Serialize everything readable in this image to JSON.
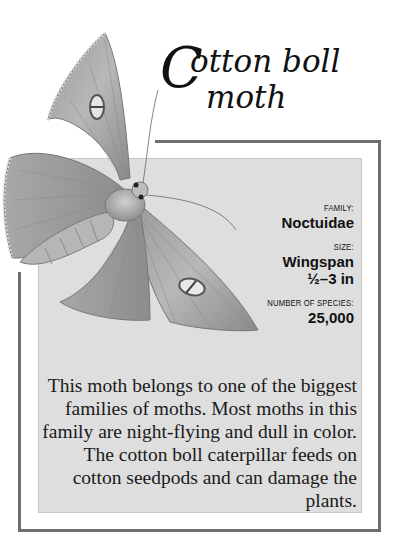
{
  "title": {
    "initial": "C",
    "line1": "otton boll",
    "line2": "moth"
  },
  "facts": [
    {
      "label": "FAMILY:",
      "value": "Noctuidae"
    },
    {
      "label": "SIZE:",
      "value": "Wingspan",
      "value2": "½–3 in"
    },
    {
      "label": "NUMBER OF SPECIES:",
      "value": "25,000"
    }
  ],
  "description": "This moth belongs to one of the biggest families of moths. Most moths in this family are night-flying and dull in color. The cotton boll caterpillar feeds on cotton seedpods and can damage the plants.",
  "illustration": {
    "subject": "moth-illustration",
    "style": "grayscale pencil drawing"
  },
  "colors": {
    "frame": "#6f6f6f",
    "panel": "#dedede",
    "text": "#111111"
  }
}
